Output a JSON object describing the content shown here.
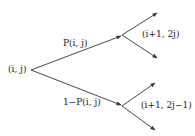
{
  "diagram": {
    "type": "binary-tree-branching",
    "root": {
      "label": "(i, j)"
    },
    "edges": [
      {
        "label": "P(i, j)"
      },
      {
        "label": "1−P(i, j)"
      }
    ],
    "children": [
      {
        "label": "(i+1, 2j)"
      },
      {
        "label": "(i+1, 2j−1)"
      }
    ],
    "colors": {
      "line": "#333333",
      "text": "#222222",
      "background": "#ffffff"
    }
  }
}
